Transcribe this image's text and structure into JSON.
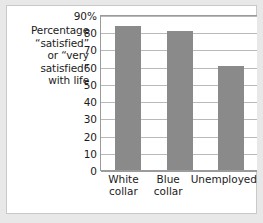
{
  "figure": {
    "caption_lines": [
      "Percentage",
      "“satisfied”",
      "or “very",
      "satisfied”",
      "with life"
    ],
    "bar_color": "#8a8a8a",
    "gridline_color": "#b9b9b9",
    "axis_color": "#9b9b9b",
    "frame_color": "#e8e8e8",
    "background_color": "#ffffff"
  },
  "chart_data": {
    "type": "bar",
    "title": "",
    "subtitle": "",
    "xlabel": "",
    "ylabel": "Percentage “satisfied” or “very satisfied” with life",
    "categories": [
      "White collar",
      "Blue collar",
      "Unemployed"
    ],
    "category_lines": [
      [
        "White",
        "collar"
      ],
      [
        "Blue",
        "collar"
      ],
      [
        "Unemployed"
      ]
    ],
    "values": [
      84,
      81,
      61
    ],
    "ylim": [
      0,
      90
    ],
    "yticks": [
      0,
      10,
      20,
      30,
      40,
      50,
      60,
      70,
      80,
      90
    ],
    "ytick_labels": [
      "0",
      "10",
      "20",
      "30",
      "40",
      "50",
      "60",
      "70",
      "80",
      "90%"
    ],
    "grid": true,
    "legend": false,
    "legend_position": "none"
  }
}
